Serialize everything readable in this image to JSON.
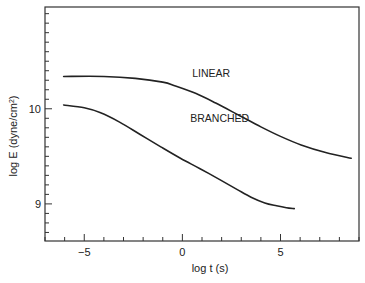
{
  "chart_data": {
    "type": "line",
    "title": "",
    "xlabel": "log t (s)",
    "ylabel": "log E (dyne/cm²)",
    "ylabel_parts": {
      "main": "log E (dyne/cm",
      "sup": "2",
      "end": ")"
    },
    "xlim": [
      -7,
      9
    ],
    "ylim": [
      8.61,
      11.07
    ],
    "x_ticks_major": [
      -5,
      0,
      5
    ],
    "x_tick_labels": [
      "−5",
      "0",
      "5"
    ],
    "x_ticks_minor_step": 1,
    "y_ticks_major": [
      9,
      10
    ],
    "y_tick_labels": [
      "9",
      "10"
    ],
    "y_ticks_minor_step": 0.1,
    "grid": false,
    "legend": "inline annotations",
    "series": [
      {
        "name": "LINEAR",
        "label_pos": {
          "x": 0.5,
          "y": 10.33
        },
        "x": [
          -6.05,
          -4.0,
          -2.4,
          -1.0,
          -0.35,
          0.7,
          1.7,
          2.9,
          4.0,
          5.0,
          6.05,
          7.3,
          8.6
        ],
        "y": [
          10.34,
          10.34,
          10.32,
          10.28,
          10.24,
          10.16,
          10.06,
          9.93,
          9.81,
          9.71,
          9.62,
          9.54,
          9.48
        ]
      },
      {
        "name": "BRANCHED",
        "label_pos": {
          "x": 0.4,
          "y": 9.86
        },
        "x": [
          -6.05,
          -5.0,
          -4.2,
          -3.2,
          -2.15,
          -1.1,
          -0.1,
          0.9,
          1.95,
          2.8,
          3.5,
          4.2,
          4.8,
          5.3,
          5.7
        ],
        "y": [
          10.04,
          10.01,
          9.96,
          9.86,
          9.73,
          9.6,
          9.48,
          9.37,
          9.25,
          9.15,
          9.07,
          9.01,
          8.98,
          8.96,
          8.95
        ]
      }
    ]
  }
}
